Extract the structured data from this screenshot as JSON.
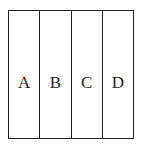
{
  "diagram": {
    "type": "partitioned-rectangle",
    "orientation": "vertical-strips",
    "regions": [
      {
        "label": "A"
      },
      {
        "label": "B"
      },
      {
        "label": "C"
      },
      {
        "label": "D"
      }
    ],
    "colors": {
      "stroke": "#222222",
      "background": "#ffffff"
    }
  }
}
